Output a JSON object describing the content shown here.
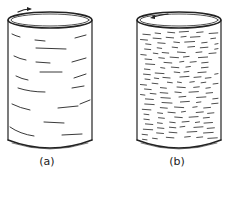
{
  "figure": {
    "panels": [
      {
        "id": "a",
        "label": "(a)",
        "description": "cylinder with sparse long horizontal streaks, rotation arrow pointing right on top rim"
      },
      {
        "id": "b",
        "label": "(b)",
        "description": "cylinder with dense short horizontal dashes, rotation arrow pointing left on top rim"
      }
    ]
  },
  "colors": {
    "stroke": "#222222",
    "background": "#ffffff"
  }
}
